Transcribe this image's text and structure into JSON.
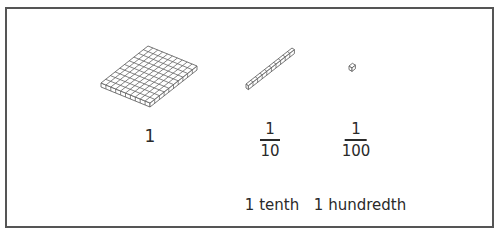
{
  "figure": {
    "border_color": "#555555",
    "line_color": "#666666",
    "items": [
      {
        "name": "flat",
        "block": "hundred-flat (10x10 grid)",
        "value_label": "1"
      },
      {
        "name": "rod",
        "block": "ten-rod (10 cubes)",
        "fraction": {
          "numerator": "1",
          "denominator": "10"
        },
        "word_label": "1 tenth"
      },
      {
        "name": "unit",
        "block": "unit-cube",
        "fraction": {
          "numerator": "1",
          "denominator": "100"
        },
        "word_label": "1 hundredth"
      }
    ]
  }
}
